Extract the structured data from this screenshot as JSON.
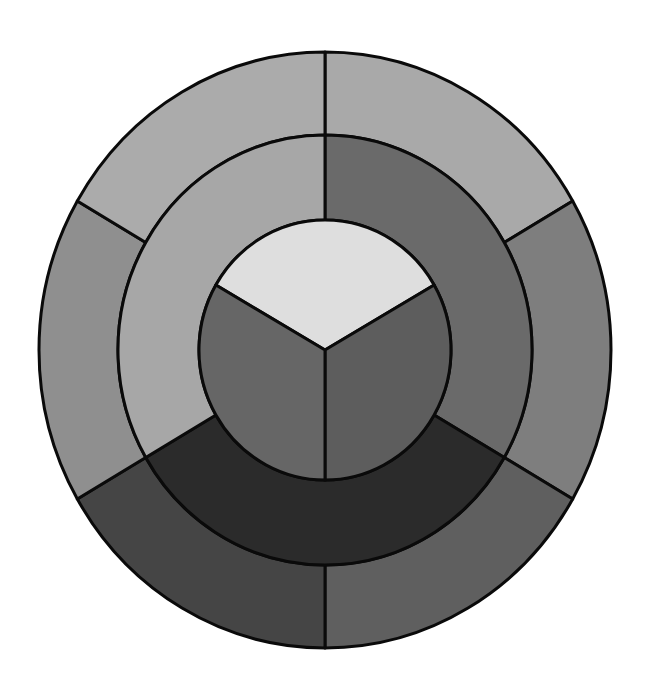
{
  "diagram": {
    "title": "",
    "type": "color-wheel",
    "geometry": {
      "center": [
        325,
        350
      ],
      "outer_radius": [
        286,
        298
      ],
      "middle_radius": [
        207,
        215
      ],
      "inner_radius": [
        126,
        130
      ]
    },
    "rings": {
      "outer": {
        "name": "tertiary-ring",
        "segments": [
          {
            "id": "outer-top-right",
            "start_deg": 90,
            "end_deg": 30,
            "fill": "#a9a9a9"
          },
          {
            "id": "outer-right",
            "start_deg": 30,
            "end_deg": -30,
            "fill": "#7e7e7e"
          },
          {
            "id": "outer-bottom-right",
            "start_deg": -30,
            "end_deg": -90,
            "fill": "#5f5f5f"
          },
          {
            "id": "outer-bottom-left",
            "start_deg": -90,
            "end_deg": -150,
            "fill": "#454545"
          },
          {
            "id": "outer-left",
            "start_deg": 210,
            "end_deg": 150,
            "fill": "#8f8f8f"
          },
          {
            "id": "outer-top-left",
            "start_deg": 150,
            "end_deg": 90,
            "fill": "#ababab"
          }
        ]
      },
      "middle": {
        "name": "secondary-ring",
        "segments": [
          {
            "id": "middle-right",
            "start_deg": 90,
            "end_deg": -30,
            "fill": "#6a6a6a"
          },
          {
            "id": "middle-bottom",
            "start_deg": -30,
            "end_deg": -150,
            "fill": "#2b2b2b"
          },
          {
            "id": "middle-left",
            "start_deg": 210,
            "end_deg": 90,
            "fill": "#a7a7a7"
          }
        ]
      },
      "inner": {
        "name": "primary-circle",
        "segments": [
          {
            "id": "inner-top",
            "start_deg": 150,
            "end_deg": 30,
            "fill": "#dedede"
          },
          {
            "id": "inner-bottom-right",
            "start_deg": 30,
            "end_deg": -90,
            "fill": "#5d5d5d"
          },
          {
            "id": "inner-bottom-left",
            "start_deg": 270,
            "end_deg": 150,
            "fill": "#666666"
          }
        ]
      }
    },
    "colors": {
      "stroke": "#0a0a0a",
      "background": "#ffffff"
    }
  }
}
